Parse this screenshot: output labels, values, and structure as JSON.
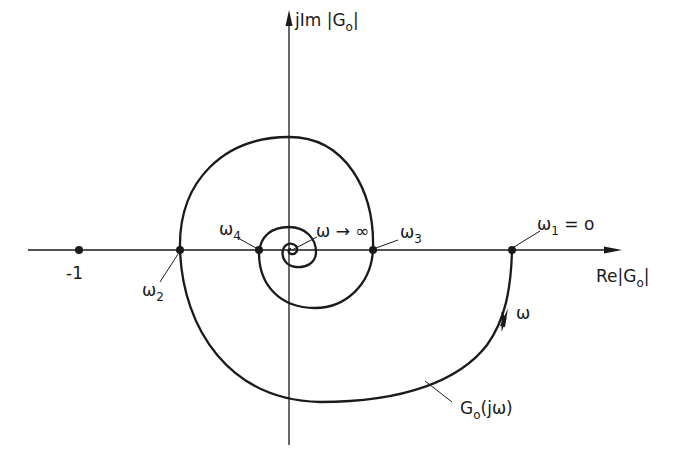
{
  "diagram": {
    "type": "nyquist-plot",
    "axes": {
      "imag_label": "jIm |G",
      "imag_label_sub": "o",
      "imag_label_end": "|",
      "real_label": "Re|G",
      "real_label_sub": "o",
      "real_label_end": "|"
    },
    "points": {
      "minus_one": "-1",
      "omega1": {
        "symbol": "ω",
        "sub": "1",
        "suffix": " = o"
      },
      "omega2": {
        "symbol": "ω",
        "sub": "2"
      },
      "omega3": {
        "symbol": "ω",
        "sub": "3"
      },
      "omega4": {
        "symbol": "ω",
        "sub": "4"
      },
      "omega_inf": "ω → ∞"
    },
    "curve": {
      "name": "G",
      "name_sub": "o",
      "name_suffix": "(jω)",
      "direction_label": "ω"
    },
    "colors": {
      "ink": "#1a1a1a",
      "background": "#ffffff"
    }
  }
}
